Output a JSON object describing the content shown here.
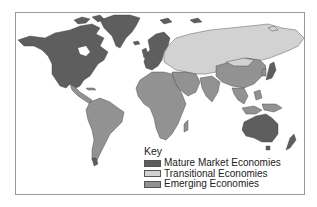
{
  "map": {
    "title": "",
    "colors": {
      "mature": "#5e5e5e",
      "transitional": "#d2d2d2",
      "emerging": "#929292",
      "border": "#3a3a3a"
    },
    "regions": [
      {
        "name": "North America",
        "category": "Mature Market Economies"
      },
      {
        "name": "Greenland",
        "category": "Mature Market Economies"
      },
      {
        "name": "Western Europe",
        "category": "Mature Market Economies"
      },
      {
        "name": "Japan",
        "category": "Mature Market Economies"
      },
      {
        "name": "Australia",
        "category": "Mature Market Economies"
      },
      {
        "name": "New Zealand",
        "category": "Mature Market Economies"
      },
      {
        "name": "Russia / Eastern Europe / Central Asia",
        "category": "Transitional Economies"
      },
      {
        "name": "Mongolia",
        "category": "Transitional Economies"
      },
      {
        "name": "Latin America",
        "category": "Emerging Economies"
      },
      {
        "name": "Africa",
        "category": "Emerging Economies"
      },
      {
        "name": "Middle East",
        "category": "Emerging Economies"
      },
      {
        "name": "China",
        "category": "Emerging Economies"
      },
      {
        "name": "South Asia",
        "category": "Emerging Economies"
      },
      {
        "name": "Southeast Asia",
        "category": "Emerging Economies"
      }
    ]
  },
  "legend": {
    "title": "Key",
    "items": [
      {
        "label": "Mature Market Economies",
        "color": "#5e5e5e"
      },
      {
        "label": "Transitional Economies",
        "color": "#d2d2d2"
      },
      {
        "label": "Emerging Economies",
        "color": "#929292"
      }
    ]
  }
}
